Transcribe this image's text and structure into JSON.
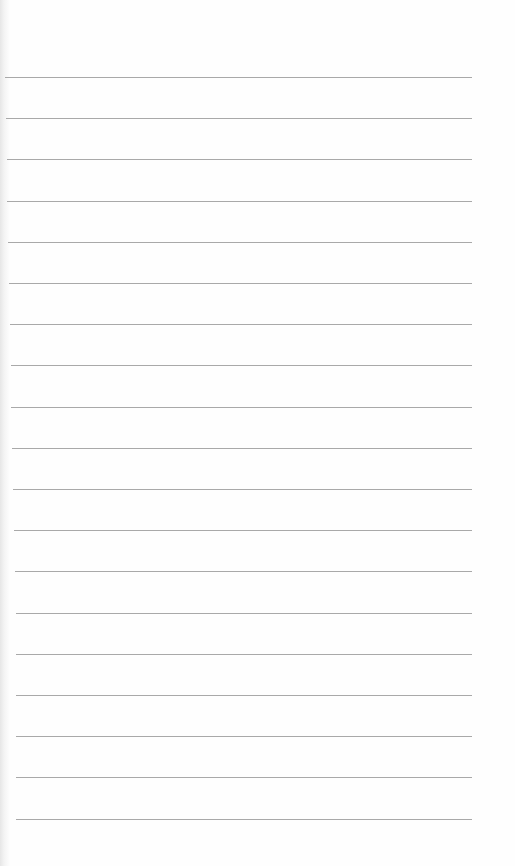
{
  "page": {
    "type": "lined-paper",
    "background_color": "#fefefe",
    "rule_color": "#9a9a9a",
    "rule_count": 19,
    "first_rule_y": 77,
    "rule_spacing": 41.2,
    "rule_left": 5,
    "rule_right": 472
  }
}
